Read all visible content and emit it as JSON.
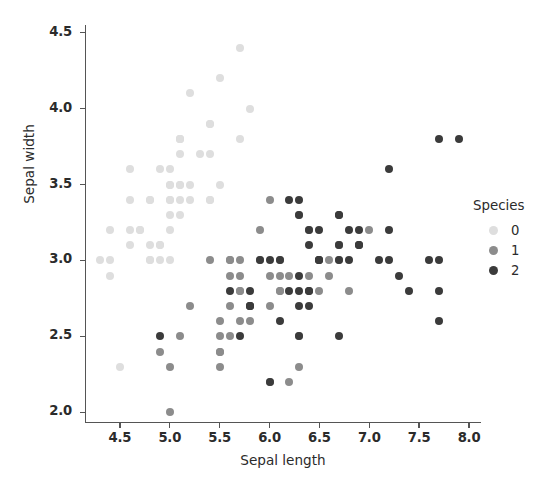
{
  "chart_data": {
    "type": "scatter",
    "title": "",
    "xlabel": "Sepal length",
    "ylabel": "Sepal width",
    "xlim": [
      4.15,
      8.12
    ],
    "ylim": [
      1.93,
      4.55
    ],
    "xticks": [
      "4.5",
      "5.0",
      "5.5",
      "6.0",
      "6.5",
      "7.0",
      "7.5",
      "8.0"
    ],
    "xtick_values": [
      4.5,
      5.0,
      5.5,
      6.0,
      6.5,
      7.0,
      7.5,
      8.0
    ],
    "yticks": [
      "2.0",
      "2.5",
      "3.0",
      "3.5",
      "4.0",
      "4.5"
    ],
    "ytick_values": [
      2.0,
      2.5,
      3.0,
      3.5,
      4.0,
      4.5
    ],
    "grid": false,
    "legend": {
      "title": "Species",
      "position": "right",
      "entries": [
        {
          "label": "0",
          "color": "#dedede"
        },
        {
          "label": "1",
          "color": "#8c8c8c"
        },
        {
          "label": "2",
          "color": "#3b3b3b"
        }
      ]
    },
    "series": [
      {
        "name": "0",
        "color": "#dedede",
        "points": [
          [
            5.1,
            3.5
          ],
          [
            4.9,
            3.0
          ],
          [
            4.7,
            3.2
          ],
          [
            4.6,
            3.1
          ],
          [
            5.0,
            3.6
          ],
          [
            5.4,
            3.9
          ],
          [
            4.6,
            3.4
          ],
          [
            5.0,
            3.4
          ],
          [
            4.4,
            2.9
          ],
          [
            4.9,
            3.1
          ],
          [
            5.4,
            3.7
          ],
          [
            4.8,
            3.4
          ],
          [
            4.8,
            3.0
          ],
          [
            4.3,
            3.0
          ],
          [
            5.8,
            4.0
          ],
          [
            5.7,
            4.4
          ],
          [
            5.4,
            3.9
          ],
          [
            5.1,
            3.5
          ],
          [
            5.7,
            3.8
          ],
          [
            5.1,
            3.8
          ],
          [
            5.4,
            3.4
          ],
          [
            5.1,
            3.7
          ],
          [
            4.6,
            3.6
          ],
          [
            5.1,
            3.3
          ],
          [
            4.8,
            3.4
          ],
          [
            5.0,
            3.0
          ],
          [
            5.0,
            3.4
          ],
          [
            5.2,
            3.5
          ],
          [
            5.2,
            3.4
          ],
          [
            4.7,
            3.2
          ],
          [
            4.8,
            3.1
          ],
          [
            5.4,
            3.4
          ],
          [
            5.2,
            4.1
          ],
          [
            5.5,
            4.2
          ],
          [
            4.9,
            3.1
          ],
          [
            5.0,
            3.2
          ],
          [
            5.5,
            3.5
          ],
          [
            4.9,
            3.6
          ],
          [
            4.4,
            3.0
          ],
          [
            5.1,
            3.4
          ],
          [
            5.0,
            3.5
          ],
          [
            4.5,
            2.3
          ],
          [
            4.4,
            3.2
          ],
          [
            5.0,
            3.5
          ],
          [
            5.1,
            3.8
          ],
          [
            4.8,
            3.0
          ],
          [
            5.1,
            3.8
          ],
          [
            4.6,
            3.2
          ],
          [
            5.3,
            3.7
          ],
          [
            5.0,
            3.3
          ]
        ]
      },
      {
        "name": "1",
        "color": "#8c8c8c",
        "points": [
          [
            7.0,
            3.2
          ],
          [
            6.4,
            3.2
          ],
          [
            6.9,
            3.1
          ],
          [
            5.5,
            2.3
          ],
          [
            6.5,
            2.8
          ],
          [
            5.7,
            2.8
          ],
          [
            6.3,
            3.3
          ],
          [
            4.9,
            2.4
          ],
          [
            6.6,
            2.9
          ],
          [
            5.2,
            2.7
          ],
          [
            5.0,
            2.0
          ],
          [
            5.9,
            3.0
          ],
          [
            6.0,
            2.2
          ],
          [
            6.1,
            2.9
          ],
          [
            5.6,
            2.9
          ],
          [
            6.7,
            3.1
          ],
          [
            5.6,
            3.0
          ],
          [
            5.8,
            2.7
          ],
          [
            6.2,
            2.2
          ],
          [
            5.6,
            2.5
          ],
          [
            5.9,
            3.2
          ],
          [
            6.1,
            2.8
          ],
          [
            6.3,
            2.5
          ],
          [
            6.1,
            2.8
          ],
          [
            6.4,
            2.9
          ],
          [
            6.6,
            3.0
          ],
          [
            6.8,
            2.8
          ],
          [
            6.7,
            3.0
          ],
          [
            6.0,
            2.9
          ],
          [
            5.7,
            2.6
          ],
          [
            5.5,
            2.4
          ],
          [
            5.5,
            2.4
          ],
          [
            5.8,
            2.7
          ],
          [
            6.0,
            2.7
          ],
          [
            5.4,
            3.0
          ],
          [
            6.0,
            3.4
          ],
          [
            6.7,
            3.1
          ],
          [
            6.3,
            2.3
          ],
          [
            5.6,
            3.0
          ],
          [
            5.5,
            2.5
          ],
          [
            5.5,
            2.6
          ],
          [
            6.1,
            3.0
          ],
          [
            5.8,
            2.6
          ],
          [
            5.0,
            2.3
          ],
          [
            5.6,
            2.7
          ],
          [
            5.7,
            3.0
          ],
          [
            5.7,
            2.9
          ],
          [
            6.2,
            2.9
          ],
          [
            5.1,
            2.5
          ],
          [
            5.7,
            2.8
          ]
        ]
      },
      {
        "name": "2",
        "color": "#3b3b3b",
        "points": [
          [
            6.3,
            3.3
          ],
          [
            5.8,
            2.7
          ],
          [
            7.1,
            3.0
          ],
          [
            6.3,
            2.9
          ],
          [
            6.5,
            3.0
          ],
          [
            7.6,
            3.0
          ],
          [
            4.9,
            2.5
          ],
          [
            7.3,
            2.9
          ],
          [
            6.7,
            2.5
          ],
          [
            7.2,
            3.6
          ],
          [
            6.5,
            3.2
          ],
          [
            6.4,
            2.7
          ],
          [
            6.8,
            3.0
          ],
          [
            5.7,
            2.5
          ],
          [
            5.8,
            2.8
          ],
          [
            6.4,
            3.2
          ],
          [
            6.5,
            3.0
          ],
          [
            7.7,
            3.8
          ],
          [
            7.7,
            2.6
          ],
          [
            6.0,
            2.2
          ],
          [
            6.9,
            3.2
          ],
          [
            5.6,
            2.8
          ],
          [
            7.7,
            2.8
          ],
          [
            6.3,
            2.7
          ],
          [
            6.7,
            3.3
          ],
          [
            7.2,
            3.2
          ],
          [
            6.2,
            2.8
          ],
          [
            6.1,
            3.0
          ],
          [
            6.4,
            2.8
          ],
          [
            7.2,
            3.0
          ],
          [
            7.4,
            2.8
          ],
          [
            7.9,
            3.8
          ],
          [
            6.4,
            2.8
          ],
          [
            6.3,
            2.8
          ],
          [
            6.1,
            2.6
          ],
          [
            7.7,
            3.0
          ],
          [
            6.3,
            3.4
          ],
          [
            6.4,
            3.1
          ],
          [
            6.0,
            3.0
          ],
          [
            6.9,
            3.1
          ],
          [
            6.7,
            3.1
          ],
          [
            6.9,
            3.1
          ],
          [
            5.8,
            2.7
          ],
          [
            6.8,
            3.2
          ],
          [
            6.7,
            3.3
          ],
          [
            6.7,
            3.0
          ],
          [
            6.3,
            2.5
          ],
          [
            6.5,
            3.0
          ],
          [
            6.2,
            3.4
          ],
          [
            5.9,
            3.0
          ]
        ]
      }
    ]
  }
}
